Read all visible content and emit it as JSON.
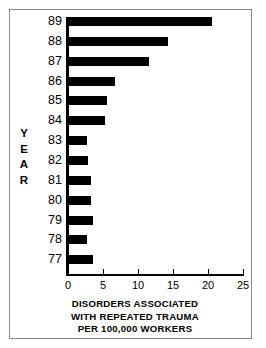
{
  "frame": {
    "border_color": "#8a8a8a",
    "background": "#ffffff"
  },
  "chart_data": {
    "type": "bar",
    "orientation": "horizontal",
    "title": "DISORDERS ASSOCIATED WITH REPEATED TRAUMA PER 100,000 WORKERS",
    "title_lines": [
      "DISORDERS ASSOCIATED",
      "WITH REPEATED TRAUMA",
      "PER 100,000 WORKERS"
    ],
    "xlabel": "DISORDERS ASSOCIATED WITH REPEATED TRAUMA PER 100,000 WORKERS",
    "ylabel": "YEAR",
    "ylabel_letters": [
      "Y",
      "E",
      "A",
      "R"
    ],
    "categories": [
      "89",
      "88",
      "87",
      "86",
      "85",
      "84",
      "83",
      "82",
      "81",
      "80",
      "79",
      "78",
      "77"
    ],
    "values": [
      20.6,
      14.3,
      11.6,
      6.7,
      5.6,
      5.3,
      2.7,
      2.9,
      3.3,
      3.3,
      3.6,
      2.7,
      3.6
    ],
    "xlim": [
      0,
      25
    ],
    "ylim": null,
    "xticks": [
      0,
      5,
      10,
      15,
      20,
      25
    ],
    "xtick_labels": [
      "0",
      "5",
      "10",
      "15",
      "20",
      "25"
    ],
    "grid": false,
    "legend": null,
    "bar_color": "#000000",
    "axis_color": "#000000",
    "series": [
      {
        "name": "Disorders associated with repeated trauma per 100,000 workers",
        "values": [
          20.6,
          14.3,
          11.6,
          6.7,
          5.6,
          5.3,
          2.7,
          2.9,
          3.3,
          3.3,
          3.6,
          2.7,
          3.6
        ]
      }
    ]
  }
}
